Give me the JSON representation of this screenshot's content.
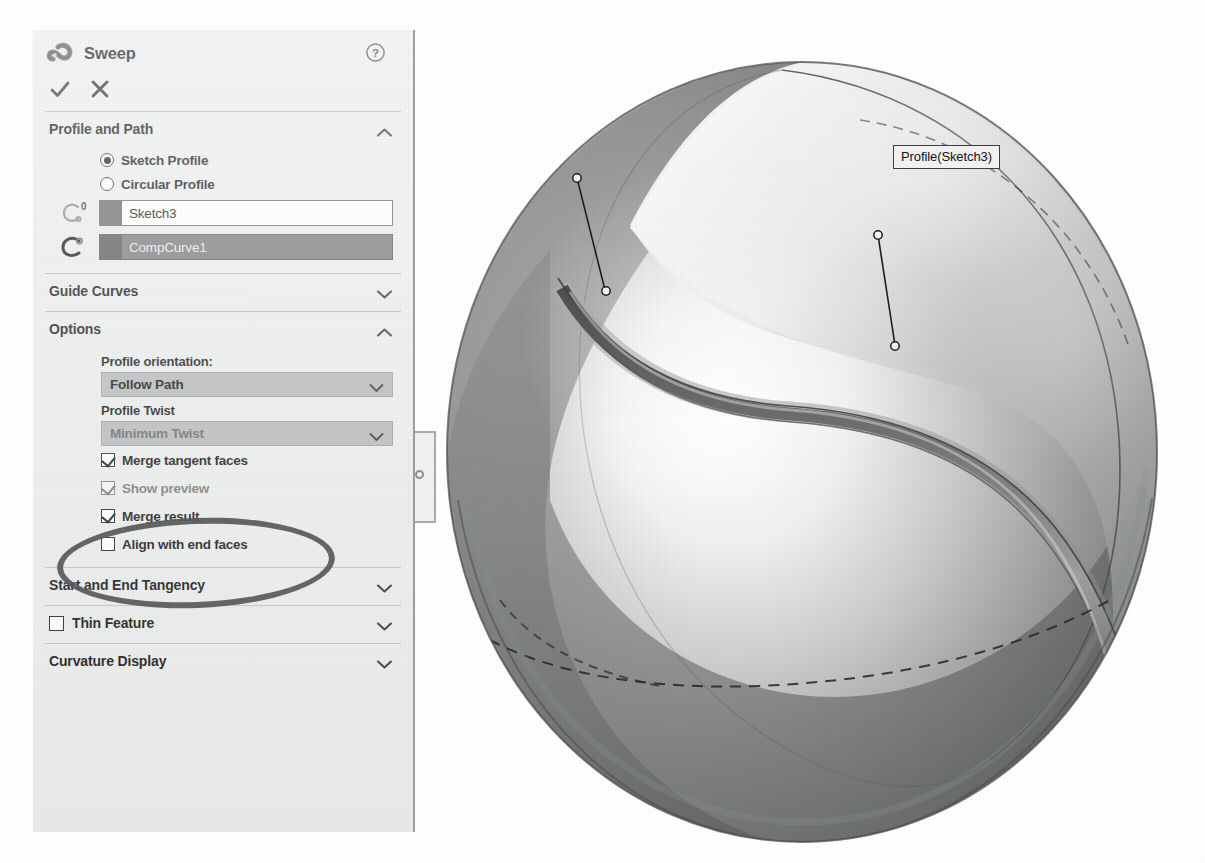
{
  "panel": {
    "title": "Sweep",
    "icon": "sweep-icon",
    "help_icon": "help-question-icon",
    "accept_label": "✓",
    "cancel_label": "✕",
    "sections": {
      "profile_and_path": {
        "title": "Profile and Path",
        "expanded": true,
        "chevron": "chevron-up-icon",
        "radios": [
          {
            "label": "Sketch Profile",
            "selected": true
          },
          {
            "label": "Circular Profile",
            "selected": false
          }
        ],
        "selections": [
          {
            "icon": "profile-curve-icon",
            "value": "Sketch3",
            "selected": false
          },
          {
            "icon": "path-curve-icon",
            "value": "CompCurve1",
            "selected": true
          }
        ]
      },
      "guide_curves": {
        "title": "Guide Curves",
        "expanded": false,
        "chevron": "chevron-down-icon"
      },
      "options": {
        "title": "Options",
        "expanded": true,
        "chevron": "chevron-up-icon",
        "profile_orientation_label": "Profile orientation:",
        "profile_orientation_value": "Follow Path",
        "profile_twist_label": "Profile Twist",
        "profile_twist_value": "Minimum Twist",
        "checkboxes": [
          {
            "label": "Merge tangent faces",
            "checked": true
          },
          {
            "label": "Show preview",
            "checked": true
          },
          {
            "label": "Merge result",
            "checked": true
          },
          {
            "label": "Align with end faces",
            "checked": false
          }
        ]
      },
      "start_and_end_tangency": {
        "title": "Start and End Tangency",
        "expanded": false,
        "chevron": "chevron-down-icon"
      },
      "thin_feature": {
        "title": "Thin Feature",
        "expanded": false,
        "checked": false,
        "chevron": "chevron-down-icon"
      },
      "curvature_display": {
        "title": "Curvature Display",
        "expanded": false,
        "chevron": "chevron-down-icon"
      }
    },
    "pin_tab": "panel-resize-pin"
  },
  "annotation": {
    "highlight_shape": "ellipse",
    "highlight_target": "Merge tangent faces",
    "highlight_color": "#58595b"
  },
  "viewport": {
    "callouts": [
      {
        "text": "Profile(Sketch3)",
        "name": "callout-profile"
      },
      {
        "text": "Path(CompCurve1)",
        "name": "callout-path"
      }
    ],
    "model": "sphere-with-swept-seam-groove"
  },
  "colors": {
    "panel_bg": "#eceded",
    "combo_bg": "#b9bbbc",
    "selected_field_bg": "#7c7e80",
    "divider": "#b9bbbd",
    "text": "#1f1f1f",
    "marker": "#58595b"
  }
}
